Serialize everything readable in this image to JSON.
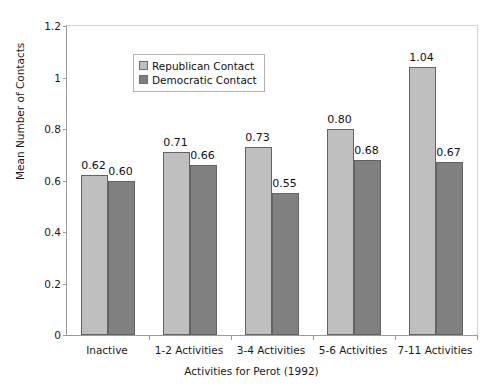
{
  "chart_data": {
    "type": "bar",
    "title": "",
    "xlabel": "Activities for Perot (1992)",
    "ylabel": "Mean Number of Contacts",
    "categories": [
      "Inactive",
      "1-2 Activities",
      "3-4 Activities",
      "5-6 Activities",
      "7-11 Activities"
    ],
    "series": [
      {
        "name": "Republican Contact",
        "color": "#bfbfbf",
        "values": [
          0.62,
          0.71,
          0.73,
          0.8,
          1.04
        ],
        "labels": [
          "0.62",
          "0.71",
          "0.73",
          "0.80",
          "1.04"
        ]
      },
      {
        "name": "Democratic Contact",
        "color": "#808080",
        "values": [
          0.6,
          0.66,
          0.55,
          0.68,
          0.67
        ],
        "labels": [
          "0.60",
          "0.66",
          "0.55",
          "0.68",
          "0.67"
        ]
      }
    ],
    "ylim": [
      0,
      1.2
    ],
    "ytick_values": [
      0,
      0.2,
      0.4,
      0.6,
      0.8,
      1,
      1.2
    ],
    "ytick_labels": [
      "0",
      "0.2",
      "0.4",
      "0.6",
      "0.8",
      "1",
      "1.2"
    ],
    "grid": false,
    "legend_position": "upper-left-inside"
  },
  "legend": {
    "entries": [
      {
        "label": "Republican Contact"
      },
      {
        "label": "Democratic Contact"
      }
    ]
  },
  "axes": {
    "x_title": "Activities for Perot (1992)",
    "y_title": "Mean Number of Contacts"
  }
}
